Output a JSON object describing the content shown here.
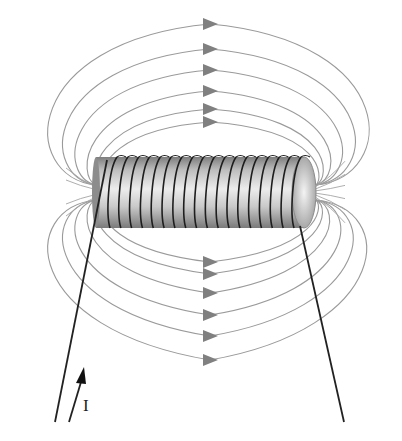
{
  "diagram": {
    "current_label": "I",
    "colors": {
      "field_line": "#8f8f8f",
      "arrow": "#7a7a7a",
      "wire": "#222222",
      "core_light": "#e6e6e6",
      "core_dark": "#8a8a8a"
    },
    "solenoid": {
      "x_left": 96,
      "x_right": 316,
      "y_top": 157,
      "y_bottom": 228,
      "turns": 18
    },
    "field_lines_top": [
      {
        "arrow_y": 24,
        "outer_x_left": 19,
        "outer_x_right": 392
      },
      {
        "arrow_y": 49,
        "outer_x_left": 40,
        "outer_x_right": 373
      },
      {
        "arrow_y": 70,
        "outer_x_left": 58,
        "outer_x_right": 355
      },
      {
        "arrow_y": 91,
        "outer_x_left": 77,
        "outer_x_right": 338
      },
      {
        "arrow_y": 109,
        "outer_x_left": 91,
        "outer_x_right": 326
      },
      {
        "arrow_y": 122,
        "outer_x_left": 101,
        "outer_x_right": 318
      }
    ],
    "field_lines_bottom": [
      {
        "arrow_y": 262
      },
      {
        "arrow_y": 274
      },
      {
        "arrow_y": 293
      },
      {
        "arrow_y": 315
      },
      {
        "arrow_y": 336
      },
      {
        "arrow_y": 360
      }
    ],
    "arrow_x": 210
  }
}
